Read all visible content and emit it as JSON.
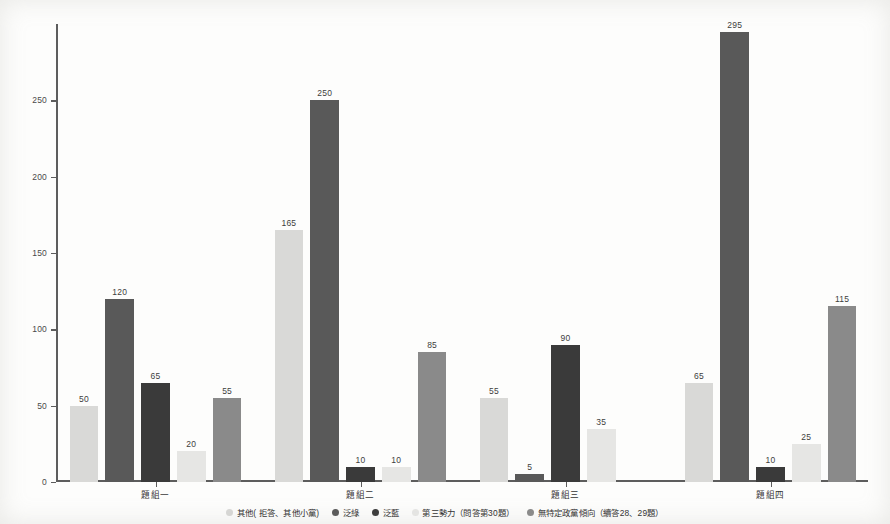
{
  "chart_data": {
    "type": "bar",
    "title": "",
    "xlabel": "",
    "ylabel": "",
    "ylim": [
      0,
      300
    ],
    "yticks": [
      0,
      50,
      100,
      150,
      200,
      250
    ],
    "grid": false,
    "legend_position": "bottom",
    "categories": [
      "題組一",
      "題組二",
      "題組三",
      "題組四"
    ],
    "series": [
      {
        "name": "其他( 拒答、其他小黨)",
        "color": "#d9d9d7",
        "values": [
          50,
          165,
          55,
          65
        ]
      },
      {
        "name": "泛綠",
        "color": "#595959",
        "values": [
          120,
          250,
          5,
          295
        ]
      },
      {
        "name": "泛藍",
        "color": "#3a3a3a",
        "values": [
          65,
          10,
          90,
          10
        ]
      },
      {
        "name": "第三勢力（問答第30題）",
        "color": "#e6e6e4",
        "values": [
          20,
          10,
          35,
          25
        ]
      },
      {
        "name": "無特定政黨傾向（續答28、29題）",
        "color": "#8a8a8a",
        "values": [
          55,
          85,
          0,
          115
        ]
      }
    ],
    "bar_labels": {
      "題組一": [
        "50",
        "120",
        "65",
        "20",
        "55"
      ],
      "題組二": [
        "165",
        "250",
        "10",
        "10",
        "85"
      ],
      "題組三": [
        "55",
        "5",
        "90",
        "35",
        ""
      ],
      "題組四": [
        "65",
        "295",
        "10",
        "25",
        "115"
      ]
    }
  },
  "legend": {
    "items": [
      {
        "label": "其他( 拒答、其他小黨)",
        "color": "#d9d9d7"
      },
      {
        "label": "泛綠",
        "color": "#595959"
      },
      {
        "label": "泛藍",
        "color": "#3a3a3a"
      },
      {
        "label": "第三勢力（問答第30題）",
        "color": "#e8e8e6"
      },
      {
        "label": "無特定政黨傾向（續答28、29題）",
        "color": "#8a8a8a"
      }
    ]
  }
}
